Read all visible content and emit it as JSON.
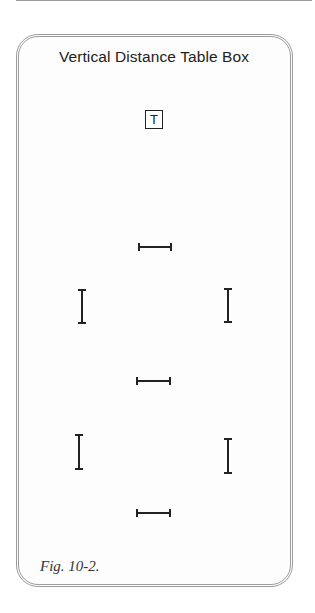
{
  "figure": {
    "title": "Vertical Distance Table Box",
    "table_marker": "T",
    "caption": "Fig. 10-2."
  },
  "markers": {
    "horizontal": [
      {
        "name": "top-center",
        "x": 138,
        "y": 243,
        "length": 34
      },
      {
        "name": "middle-center",
        "x": 136,
        "y": 377,
        "length": 35
      },
      {
        "name": "bottom-center",
        "x": 136,
        "y": 509,
        "length": 35
      }
    ],
    "vertical": [
      {
        "name": "upper-left",
        "x": 78,
        "y": 289,
        "length": 35
      },
      {
        "name": "upper-right",
        "x": 224,
        "y": 288,
        "length": 35
      },
      {
        "name": "lower-left",
        "x": 75,
        "y": 434,
        "length": 36
      },
      {
        "name": "lower-right",
        "x": 224,
        "y": 438,
        "length": 36
      }
    ]
  },
  "colors": {
    "frame_border": "#9c9c9c",
    "ink": "#222222"
  }
}
